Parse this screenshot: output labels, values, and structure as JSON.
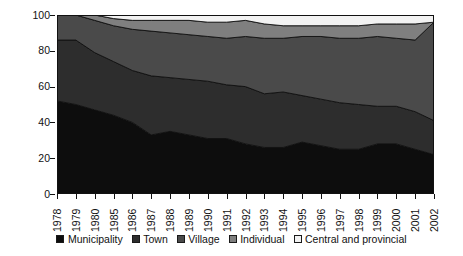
{
  "chart_data": {
    "type": "area",
    "stacked": true,
    "title": "",
    "xlabel": "",
    "ylabel": "Percentage",
    "ylim": [
      0,
      100
    ],
    "yticks": [
      0,
      20,
      40,
      60,
      80,
      100
    ],
    "grid": false,
    "legend_position": "bottom",
    "categories": [
      "1978",
      "1979",
      "1980",
      "1985",
      "1986",
      "1987",
      "1988",
      "1989",
      "1990",
      "1991",
      "1992",
      "1993",
      "1994",
      "1995",
      "1996",
      "1997",
      "1998",
      "1999",
      "2000",
      "2001",
      "2002"
    ],
    "series": [
      {
        "name": "Municipality",
        "color": "#0d0d0d",
        "values": [
          52,
          50,
          47,
          44,
          40,
          33,
          35,
          33,
          31,
          31,
          28,
          26,
          26,
          29,
          27,
          25,
          25,
          28,
          28,
          25,
          22
        ]
      },
      {
        "name": "Town",
        "color": "#2d2d2d",
        "values": [
          34,
          36,
          32,
          30,
          29,
          33,
          30,
          31,
          32,
          30,
          32,
          30,
          31,
          26,
          26,
          26,
          25,
          21,
          21,
          21,
          19
        ]
      },
      {
        "name": "Village",
        "color": "#4a4a4a",
        "values": [
          14,
          14,
          18,
          20,
          23,
          25,
          25,
          25,
          25,
          26,
          28,
          31,
          30,
          33,
          35,
          36,
          37,
          39,
          38,
          40,
          55
        ]
      },
      {
        "name": "Individual",
        "color": "#7f7f7f",
        "values": [
          0,
          0,
          3,
          4,
          5,
          6,
          7,
          8,
          8,
          9,
          9,
          8,
          7,
          6,
          6,
          7,
          7,
          7,
          8,
          9,
          0
        ]
      },
      {
        "name": "Central and provincial",
        "color": "#f2f2f2",
        "values": [
          0,
          0,
          0,
          2,
          3,
          3,
          3,
          3,
          4,
          4,
          3,
          5,
          6,
          6,
          6,
          6,
          6,
          5,
          5,
          5,
          4
        ]
      }
    ]
  },
  "axis": {
    "ylabel": "Percentage",
    "ytick_labels": [
      "0",
      "20",
      "40",
      "60",
      "80",
      "100"
    ]
  },
  "legend": {
    "items": [
      {
        "label": "Municipality"
      },
      {
        "label": "Town"
      },
      {
        "label": "Village"
      },
      {
        "label": "Individual"
      },
      {
        "label": "Central and provincial"
      }
    ]
  }
}
